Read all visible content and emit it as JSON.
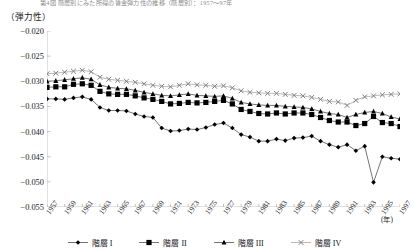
{
  "figure": {
    "title": "第4図 階層別にみた所得の賃金弾力性の推移（階層別）：1957～97年",
    "y_unit_label": "（弾力性）",
    "x_unit_label": "(年)"
  },
  "legend": {
    "position": "bottom",
    "items": [
      {
        "label": "階層 I",
        "marker": "diamond-marker",
        "color": "#000000"
      },
      {
        "label": "階層 II",
        "marker": "square-marker",
        "color": "#000000"
      },
      {
        "label": "階層 III",
        "marker": "triangle-marker",
        "color": "#000000"
      },
      {
        "label": "階層 IV",
        "marker": "x-marker",
        "color": "#808080"
      }
    ]
  },
  "chart_data": {
    "type": "line",
    "title": "第4図 階層別にみた所得の賃金弾力性の推移（階層別）：1957～97年",
    "xlabel": "(年)",
    "ylabel": "（弾力性）",
    "ylim": [
      -0.055,
      -0.02
    ],
    "yticks": [
      -0.02,
      -0.025,
      -0.03,
      -0.035,
      -0.04,
      -0.045,
      -0.05,
      -0.055
    ],
    "ytick_labels": [
      "-0.020",
      "-0.025",
      "-0.030",
      "-0.035",
      "-0.040",
      "-0.045",
      "-0.050",
      "-0.055"
    ],
    "xlim": [
      1957,
      1997
    ],
    "xticks": [
      1957,
      1959,
      1961,
      1963,
      1965,
      1967,
      1969,
      1971,
      1973,
      1975,
      1977,
      1979,
      1981,
      1983,
      1985,
      1987,
      1989,
      1991,
      1993,
      1995,
      1997
    ],
    "xtick_labels": [
      "1957",
      "1959",
      "1961",
      "1963",
      "1965",
      "1967",
      "1969",
      "1971",
      "1973",
      "1975",
      "1977",
      "1979",
      "1981",
      "1983",
      "1985",
      "1987",
      "1989",
      "1991",
      "1993",
      "1995",
      "1997"
    ],
    "grid": false,
    "legend_position": "bottom",
    "x": [
      1957,
      1958,
      1959,
      1960,
      1961,
      1962,
      1963,
      1964,
      1965,
      1966,
      1967,
      1968,
      1969,
      1970,
      1971,
      1972,
      1973,
      1974,
      1975,
      1976,
      1977,
      1978,
      1979,
      1980,
      1981,
      1982,
      1983,
      1984,
      1985,
      1986,
      1987,
      1988,
      1989,
      1990,
      1991,
      1992,
      1993,
      1994,
      1995,
      1996,
      1997
    ],
    "series": [
      {
        "name": "階層 I",
        "marker": "diamond",
        "color": "#000000",
        "values": [
          -0.0335,
          -0.0335,
          -0.0336,
          -0.0333,
          -0.0331,
          -0.0336,
          -0.0352,
          -0.0358,
          -0.0358,
          -0.0359,
          -0.0365,
          -0.037,
          -0.0372,
          -0.0393,
          -0.0399,
          -0.0398,
          -0.0395,
          -0.0396,
          -0.0392,
          -0.0386,
          -0.0383,
          -0.0393,
          -0.0406,
          -0.0411,
          -0.0419,
          -0.0419,
          -0.0415,
          -0.0418,
          -0.0413,
          -0.0412,
          -0.0409,
          -0.0419,
          -0.0426,
          -0.0431,
          -0.0426,
          -0.0438,
          -0.0429,
          -0.0501,
          -0.045,
          -0.0453,
          -0.0455
        ]
      },
      {
        "name": "階層 II",
        "marker": "square",
        "color": "#000000",
        "values": [
          -0.0312,
          -0.0311,
          -0.0311,
          -0.0306,
          -0.0305,
          -0.0308,
          -0.032,
          -0.0325,
          -0.0326,
          -0.0326,
          -0.0329,
          -0.0333,
          -0.0336,
          -0.034,
          -0.0345,
          -0.0344,
          -0.0342,
          -0.0343,
          -0.0342,
          -0.034,
          -0.0338,
          -0.0345,
          -0.0356,
          -0.036,
          -0.0364,
          -0.0365,
          -0.0363,
          -0.0365,
          -0.0363,
          -0.0363,
          -0.0366,
          -0.0372,
          -0.0378,
          -0.0381,
          -0.0381,
          -0.0388,
          -0.0384,
          -0.037,
          -0.0382,
          -0.0384,
          -0.039
        ]
      },
      {
        "name": "階層 III",
        "marker": "triangle",
        "color": "#000000",
        "values": [
          -0.03,
          -0.0299,
          -0.0297,
          -0.0295,
          -0.0293,
          -0.0296,
          -0.0307,
          -0.0312,
          -0.0314,
          -0.0315,
          -0.0318,
          -0.0322,
          -0.0325,
          -0.0328,
          -0.0329,
          -0.0327,
          -0.0325,
          -0.0328,
          -0.0329,
          -0.033,
          -0.0329,
          -0.0334,
          -0.0342,
          -0.0345,
          -0.0347,
          -0.0348,
          -0.0348,
          -0.035,
          -0.0351,
          -0.0352,
          -0.0355,
          -0.036,
          -0.0364,
          -0.0366,
          -0.0372,
          -0.0366,
          -0.0362,
          -0.036,
          -0.0364,
          -0.0371,
          -0.0375
        ]
      },
      {
        "name": "階層 IV",
        "marker": "x",
        "color": "#808080",
        "values": [
          -0.0285,
          -0.0284,
          -0.0282,
          -0.028,
          -0.0278,
          -0.0281,
          -0.0292,
          -0.0296,
          -0.0298,
          -0.03,
          -0.0302,
          -0.0305,
          -0.0308,
          -0.031,
          -0.0311,
          -0.0308,
          -0.0305,
          -0.0307,
          -0.0308,
          -0.031,
          -0.0309,
          -0.0313,
          -0.0319,
          -0.0322,
          -0.0323,
          -0.0324,
          -0.0324,
          -0.0326,
          -0.0328,
          -0.0329,
          -0.0332,
          -0.0336,
          -0.034,
          -0.0341,
          -0.0348,
          -0.0338,
          -0.0331,
          -0.0329,
          -0.0327,
          -0.0326,
          -0.0325
        ]
      }
    ]
  }
}
